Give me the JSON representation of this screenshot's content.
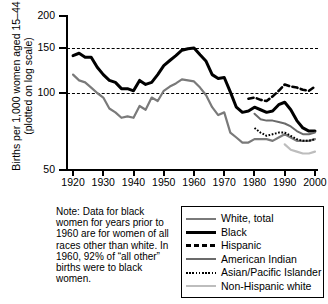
{
  "chart_data": {
    "type": "line",
    "title": "",
    "xlabel": "",
    "ylabel": "Births per 1,000 women aged 15–44 (plotted on log scale)",
    "yscale": "log",
    "ylim": [
      50,
      200
    ],
    "yticks": [
      50,
      100,
      150,
      200
    ],
    "ytick_labels": [
      "50",
      "100",
      "150",
      "200"
    ],
    "xlim": [
      1918,
      2001
    ],
    "xticks": [
      1920,
      1930,
      1940,
      1950,
      1960,
      1970,
      1980,
      1990,
      2000
    ],
    "xtick_labels": [
      "1920",
      "1930",
      "1940",
      "1950",
      "1960",
      "1970",
      "1980",
      "1990",
      "2000"
    ],
    "gridlines": [
      100,
      150
    ],
    "grid": "horizontal-dashed-at-100-and-150",
    "legend_position": "below-right",
    "series": [
      {
        "name": "White, total",
        "color": "#7a7a7a",
        "style": "solid",
        "width": 2.2,
        "x": [
          1920,
          1922,
          1924,
          1926,
          1928,
          1930,
          1932,
          1934,
          1936,
          1938,
          1940,
          1942,
          1944,
          1946,
          1948,
          1950,
          1952,
          1954,
          1956,
          1958,
          1960,
          1962,
          1964,
          1966,
          1968,
          1970,
          1972,
          1974,
          1976,
          1978,
          1980,
          1982,
          1984,
          1986,
          1988,
          1990,
          1992,
          1994,
          1996,
          1998,
          2000
        ],
        "y": [
          118,
          112,
          110,
          105,
          100,
          96,
          87,
          84,
          80,
          81,
          80,
          89,
          86,
          96,
          93,
          102,
          106,
          109,
          113,
          112,
          111,
          105,
          98,
          88,
          82,
          84,
          70,
          67,
          64,
          64,
          66,
          66,
          66,
          65,
          67,
          69,
          67,
          65,
          65,
          65,
          66
        ]
      },
      {
        "name": "Black",
        "color": "#000000",
        "style": "solid",
        "width": 3.0,
        "x": [
          1920,
          1922,
          1924,
          1926,
          1928,
          1930,
          1932,
          1934,
          1936,
          1938,
          1940,
          1942,
          1944,
          1946,
          1948,
          1950,
          1952,
          1954,
          1956,
          1958,
          1960,
          1962,
          1964,
          1966,
          1968,
          1970,
          1972,
          1974,
          1976,
          1978,
          1980,
          1982,
          1984,
          1986,
          1988,
          1990,
          1992,
          1994,
          1996,
          1998,
          2000
        ],
        "y": [
          140,
          143,
          138,
          138,
          126,
          118,
          112,
          110,
          104,
          104,
          102,
          112,
          108,
          110,
          118,
          128,
          134,
          140,
          147,
          149,
          150,
          141,
          133,
          118,
          114,
          115,
          101,
          88,
          84,
          85,
          88,
          86,
          84,
          85,
          90,
          92,
          86,
          78,
          73,
          71,
          71
        ]
      },
      {
        "name": "Hispanic",
        "color": "#000000",
        "style": "dashed",
        "width": 2.6,
        "x": [
          1978,
          1980,
          1982,
          1984,
          1986,
          1988,
          1990,
          1992,
          1994,
          1996,
          1998,
          2000
        ],
        "y": [
          95,
          96,
          94,
          93,
          97,
          102,
          108,
          106,
          105,
          103,
          102,
          106
        ]
      },
      {
        "name": "American Indian",
        "color": "#6b6b6b",
        "style": "solid",
        "width": 2.0,
        "x": [
          1980,
          1982,
          1984,
          1986,
          1988,
          1990,
          1992,
          1994,
          1996,
          1998,
          2000
        ],
        "y": [
          83,
          79,
          78,
          78,
          77,
          76,
          74,
          71,
          69,
          69,
          70
        ]
      },
      {
        "name": "Asian/Pacific Islander",
        "color": "#000000",
        "style": "dotted",
        "width": 2.0,
        "x": [
          1980,
          1982,
          1984,
          1986,
          1988,
          1990,
          1992,
          1994,
          1996,
          1998,
          2000
        ],
        "y": [
          73,
          70,
          68,
          69,
          70,
          70,
          68,
          66,
          65,
          65,
          66
        ]
      },
      {
        "name": "Non-Hispanic white",
        "color": "#bdbdbd",
        "style": "solid",
        "width": 2.2,
        "x": [
          1990,
          1992,
          1994,
          1996,
          1998,
          2000
        ],
        "y": [
          63,
          60,
          59,
          58,
          58,
          59
        ]
      }
    ]
  },
  "axis": {
    "y_label": "Births per 1,000 women aged 15–44 (plotted on log scale)"
  },
  "note": {
    "text": "Note: Data for black women for years prior to 1960 are for women of all races other than white. In 1960, 92% of “all other” births were to black women."
  },
  "legend": {
    "entries": [
      {
        "label": "White, total"
      },
      {
        "label": "Black"
      },
      {
        "label": "Hispanic"
      },
      {
        "label": "American Indian"
      },
      {
        "label": "Asian/Pacific Islander"
      },
      {
        "label": "Non-Hispanic white"
      }
    ]
  }
}
